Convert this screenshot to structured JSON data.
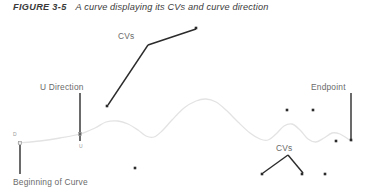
{
  "figure": {
    "caption_label": "FIGURE 3-5",
    "caption_text": "A curve displaying its CVs and curve direction",
    "caption_color": "#3a3a3a"
  },
  "annotations": {
    "cvs_top": "CVs",
    "cvs_bottom": "CVs",
    "u_direction": "U Direction",
    "beginning_of_curve": "Beginning of Curve",
    "endpoint": "Endpoint",
    "marker_start": "D",
    "marker_u": "U",
    "label_color": "#6a6a6a",
    "marker_color": "#9a9a9a"
  },
  "chart_data": {
    "type": "line",
    "title": "A curve displaying its CVs and curve direction",
    "xlabel": "",
    "ylabel": "",
    "grid": false,
    "legend": "none",
    "curve_color": "#e3e3e3",
    "cv_color": "#2b2b2b",
    "leader_color": "#2b2b2b",
    "xlim": [
      0,
      373
    ],
    "ylim": [
      0,
      193
    ],
    "series": [
      {
        "name": "NURBS curve",
        "points": [
          [
            18,
            143
          ],
          [
            40,
            141
          ],
          [
            60,
            138
          ],
          [
            80,
            134
          ],
          [
            95,
            128
          ],
          [
            106,
            122
          ],
          [
            118,
            121
          ],
          [
            128,
            124
          ],
          [
            138,
            130
          ],
          [
            146,
            136
          ],
          [
            154,
            137
          ],
          [
            162,
            131
          ],
          [
            172,
            120
          ],
          [
            184,
            108
          ],
          [
            196,
            101
          ],
          [
            206,
            99
          ],
          [
            216,
            102
          ],
          [
            226,
            110
          ],
          [
            238,
            122
          ],
          [
            250,
            133
          ],
          [
            260,
            139
          ],
          [
            268,
            140
          ],
          [
            276,
            134
          ],
          [
            284,
            126
          ],
          [
            292,
            124
          ],
          [
            300,
            130
          ],
          [
            308,
            139
          ],
          [
            316,
            142
          ],
          [
            324,
            138
          ],
          [
            332,
            133
          ],
          [
            340,
            134
          ],
          [
            348,
            139
          ],
          [
            352,
            141
          ]
        ]
      }
    ],
    "control_vertices": [
      {
        "name": "cv-upper-right",
        "x": 196,
        "y": 28
      },
      {
        "name": "cv-left-diagonal",
        "x": 107,
        "y": 106
      },
      {
        "name": "cv-lower-left",
        "x": 135,
        "y": 168
      },
      {
        "name": "cv-right-upper-a",
        "x": 287,
        "y": 110
      },
      {
        "name": "cv-right-upper-b",
        "x": 313,
        "y": 110
      },
      {
        "name": "cv-bottom-a",
        "x": 262,
        "y": 174
      },
      {
        "name": "cv-bottom-b",
        "x": 302,
        "y": 174
      },
      {
        "name": "cv-bottom-c",
        "x": 325,
        "y": 174
      },
      {
        "name": "cv-endpoint-a",
        "x": 336,
        "y": 141
      },
      {
        "name": "cv-endpoint-b",
        "x": 351,
        "y": 140
      }
    ],
    "leader_lines": [
      {
        "name": "cvs-top-leader-right",
        "x1": 148,
        "y1": 45,
        "x2": 196,
        "y2": 29
      },
      {
        "name": "cvs-top-leader-left",
        "x1": 148,
        "y1": 45,
        "x2": 108,
        "y2": 105
      },
      {
        "name": "u-direction-leader",
        "x1": 80,
        "y1": 93,
        "x2": 80,
        "y2": 141
      },
      {
        "name": "beginning-of-curve-leader",
        "x1": 20,
        "y1": 145,
        "x2": 20,
        "y2": 174
      },
      {
        "name": "endpoint-leader",
        "x1": 351,
        "y1": 93,
        "x2": 351,
        "y2": 139
      },
      {
        "name": "cvs-bottom-leader-left",
        "x1": 288,
        "y1": 155,
        "x2": 263,
        "y2": 173
      },
      {
        "name": "cvs-bottom-leader-right",
        "x1": 288,
        "y1": 155,
        "x2": 303,
        "y2": 173
      }
    ]
  }
}
